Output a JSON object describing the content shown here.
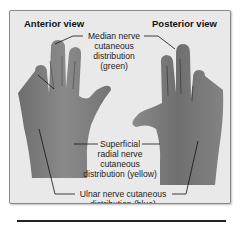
{
  "figure": {
    "views": {
      "anterior": "Anterior view",
      "posterior": "Posterior view"
    },
    "labels": {
      "median": [
        "Median nerve",
        "cutaneous",
        "distribution",
        "(green)"
      ],
      "radial": [
        "Superficial",
        "radial nerve",
        "cutaneous",
        "distribution (yellow)"
      ],
      "ulnar": [
        "Ulnar nerve cutaneous",
        "distribution (blue)"
      ]
    },
    "colors": {
      "background": "#e9e9e9",
      "skin": "#7d7d7d",
      "frame_border": "#8a8a8a"
    }
  }
}
